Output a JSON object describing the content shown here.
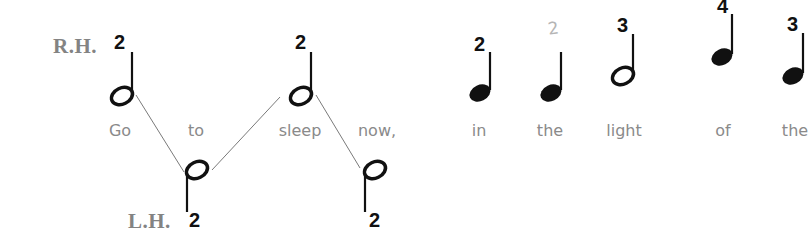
{
  "labels": {
    "right_hand": "R.H.",
    "left_hand": "L.H."
  },
  "notes": [
    {
      "lyric": "Go",
      "hand": "R.H.",
      "duration": "half",
      "finger": "2",
      "finger_style": "printed"
    },
    {
      "lyric": "to",
      "hand": "L.H.",
      "duration": "half",
      "finger": "2",
      "finger_style": "printed"
    },
    {
      "lyric": "sleep",
      "hand": "R.H.",
      "duration": "half",
      "finger": "2",
      "finger_style": "printed"
    },
    {
      "lyric": "now,",
      "hand": "L.H.",
      "duration": "half",
      "finger": "2",
      "finger_style": "printed"
    },
    {
      "lyric": "in",
      "hand": "R.H.",
      "duration": "quarter",
      "finger": "2",
      "finger_style": "printed"
    },
    {
      "lyric": "the",
      "hand": "R.H.",
      "duration": "quarter",
      "finger": "2",
      "finger_style": "pencil"
    },
    {
      "lyric": "light",
      "hand": "R.H.",
      "duration": "half",
      "finger": "3",
      "finger_style": "printed"
    },
    {
      "lyric": "of",
      "hand": "R.H.",
      "duration": "quarter",
      "finger": "4",
      "finger_style": "printed"
    },
    {
      "lyric": "the",
      "hand": "R.H.",
      "duration": "quarter",
      "finger": "3",
      "finger_style": "printed"
    }
  ],
  "colors": {
    "ink": "#111111",
    "label_gray": "#838383",
    "lyric_gray": "#8a8a8a",
    "connector_gray": "#7a7a7a",
    "pencil_gray": "#b5b5b5"
  }
}
